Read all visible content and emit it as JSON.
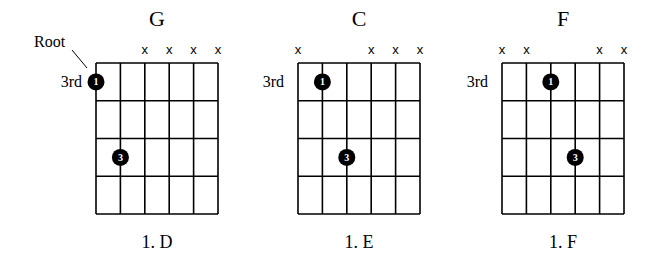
{
  "annotation": {
    "root_label": "Root"
  },
  "diagrams": [
    {
      "title": "G",
      "fret_label": "3rd",
      "caption": "1. D",
      "muted_strings": [
        3,
        4,
        5,
        6
      ],
      "dots": [
        {
          "string": 1,
          "fret": 1,
          "finger": "1"
        },
        {
          "string": 2,
          "fret": 3,
          "finger": "3"
        }
      ],
      "has_root_annotation": true
    },
    {
      "title": "C",
      "fret_label": "3rd",
      "caption": "1. E",
      "muted_strings": [
        1,
        4,
        5,
        6
      ],
      "dots": [
        {
          "string": 2,
          "fret": 1,
          "finger": "1"
        },
        {
          "string": 3,
          "fret": 3,
          "finger": "3"
        }
      ],
      "has_root_annotation": false
    },
    {
      "title": "F",
      "fret_label": "3rd",
      "caption": "1. F",
      "muted_strings": [
        1,
        2,
        5,
        6
      ],
      "dots": [
        {
          "string": 3,
          "fret": 1,
          "finger": "1"
        },
        {
          "string": 4,
          "fret": 3,
          "finger": "3"
        }
      ],
      "has_root_annotation": false
    }
  ],
  "mute_symbol": "x",
  "layout": {
    "strings": 6,
    "frets": 4
  }
}
